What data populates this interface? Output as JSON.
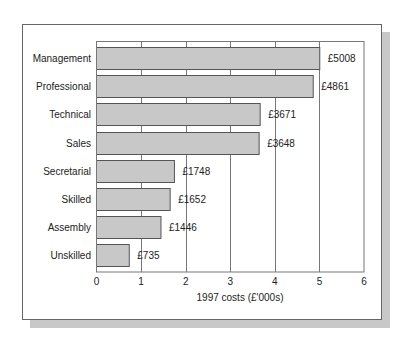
{
  "chart_data": {
    "type": "bar",
    "orientation": "horizontal",
    "title": "",
    "xlabel": "1997 costs (£'000s)",
    "ylabel": "",
    "categories": [
      "Management",
      "Professional",
      "Technical",
      "Sales",
      "Secretarial",
      "Skilled",
      "Assembly",
      "Unskilled"
    ],
    "values": [
      5008,
      4861,
      3671,
      3648,
      1748,
      1652,
      1446,
      735
    ],
    "value_labels": [
      "£5008",
      "£4861",
      "£3671",
      "£3648",
      "£1748",
      "£1652",
      "£1446",
      "£735"
    ],
    "units": "£",
    "axis_scale": "thousands",
    "xlim": [
      0,
      6
    ],
    "xticks": [
      "0",
      "1",
      "2",
      "3",
      "4",
      "5",
      "6"
    ],
    "grid": "vertical",
    "legend": "none",
    "bar_color": "#c8c8c8",
    "bar_edge_color": "#555555"
  }
}
